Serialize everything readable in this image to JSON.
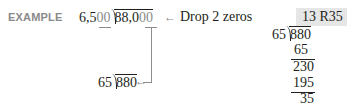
{
  "example": {
    "label": "EXAMPLE",
    "original_divisor_prefix": "6,5",
    "original_divisor_zeros": "00",
    "original_dividend_prefix": "88,0",
    "original_dividend_zeros": "00",
    "arrow_note": "Drop 2 zeros",
    "reduced_divisor": "65",
    "reduced_dividend": "880"
  },
  "long_division": {
    "answer": "13 R35",
    "divisor": "65",
    "dividend": "880",
    "steps": [
      "65",
      "230",
      "195",
      "35"
    ]
  },
  "colors": {
    "label_gray": "#8a8a8a",
    "answer_highlight": "#e6e6e6",
    "text": "#231f20"
  }
}
